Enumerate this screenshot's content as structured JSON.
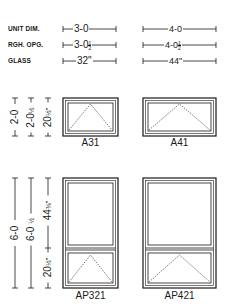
{
  "spec_table": {
    "rows": [
      {
        "label": "UNIT DIM.",
        "col1": "3-0",
        "col2": "4-0"
      },
      {
        "label": "RGH. OPG.",
        "col1": "3-0",
        "col1_frac": [
          "1",
          "2"
        ],
        "col2": "4-0",
        "col2_frac": [
          "1",
          "2"
        ]
      },
      {
        "label": "GLASS",
        "col1": "32\"",
        "col2": "44\""
      }
    ]
  },
  "awning_section": {
    "height_dims": {
      "unit": "2-0",
      "rough": "2-0",
      "rough_frac": "½",
      "glass": "20",
      "glass_frac": "½\""
    },
    "windows": [
      {
        "id": "A31",
        "label": "A31"
      },
      {
        "id": "A41",
        "label": "A41"
      }
    ]
  },
  "picture_awning_section": {
    "height_dims": {
      "unit": "6-0",
      "rough": "6-0",
      "rough_frac": "½",
      "upper_glass": "44",
      "upper_glass_frac": "⅜\"",
      "lower_glass": "20",
      "lower_glass_frac": "½\""
    },
    "windows": [
      {
        "id": "AP321",
        "label": "AP321"
      },
      {
        "id": "AP421",
        "label": "AP421"
      }
    ]
  },
  "colors": {
    "ink": "#1a1a1a",
    "paper": "#ffffff",
    "frame_gray": "#9a9a9a"
  }
}
